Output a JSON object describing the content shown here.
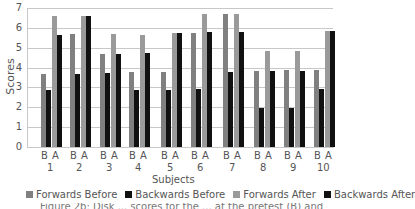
{
  "chart_data": {
    "type": "bar",
    "title": "",
    "xlabel": "Subjects",
    "ylabel": "Scores",
    "ylim": [
      0,
      7
    ],
    "yticks": [
      0,
      1,
      2,
      3,
      4,
      5,
      6,
      7
    ],
    "grid": true,
    "legend_position": "bottom",
    "categories": [
      "1",
      "2",
      "3",
      "4",
      "5",
      "6",
      "7",
      "8",
      "9",
      "10"
    ],
    "sublabels": [
      "B",
      "A"
    ],
    "series": [
      {
        "name": "Forwards Before",
        "color": "#808080",
        "values": [
          3.7,
          5.7,
          4.7,
          3.8,
          3.8,
          5.75,
          6.7,
          3.85,
          3.9,
          3.9
        ]
      },
      {
        "name": "Backwards Before",
        "color": "#111111",
        "values": [
          2.85,
          3.7,
          3.75,
          2.85,
          2.85,
          2.9,
          3.8,
          1.95,
          1.95,
          2.9
        ]
      },
      {
        "name": "Forwards After",
        "color": "#9a9a9a",
        "values": [
          6.6,
          6.6,
          5.7,
          5.65,
          5.75,
          6.7,
          6.7,
          4.85,
          4.85,
          5.85
        ]
      },
      {
        "name": "Backwards After",
        "color": "#111111",
        "values": [
          5.65,
          6.6,
          4.7,
          4.75,
          5.75,
          5.8,
          5.8,
          3.85,
          3.85,
          5.85
        ]
      }
    ]
  },
  "legend": [
    {
      "label": "Forwards Before",
      "color": "#808080"
    },
    {
      "label": "Backwards Before",
      "color": "#111111"
    },
    {
      "label": "Forwards After",
      "color": "#9a9a9a"
    },
    {
      "label": "Backwards After",
      "color": "#111111"
    }
  ],
  "caption": "Figure 2b: Disk ... scores for the ... at the pretest (B) and"
}
